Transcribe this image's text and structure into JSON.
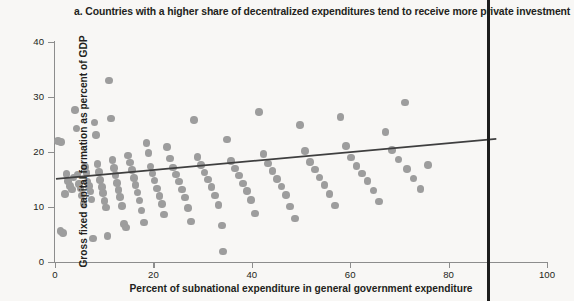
{
  "chart_data": {
    "type": "scatter",
    "title": "a. Countries with a higher share of decentralized expenditures tend to receive more private investment",
    "xlabel": "Percent of subnational expenditure in general government expenditure",
    "ylabel": "Gross fixed capital formation as percent of GDP",
    "xlim": [
      0,
      100
    ],
    "ylim": [
      0,
      40
    ],
    "xticks": [
      0,
      20,
      40,
      60,
      80,
      100
    ],
    "yticks": [
      0,
      10,
      20,
      30,
      40
    ],
    "grid": false,
    "legend": null,
    "marker_color": "#9d9d9d",
    "trendline_color": "#3f3f3f",
    "background_color": "#f8f7f5",
    "axis_color": "#8d8d8d",
    "text_color": "#231f20",
    "trendline": {
      "type": "linear",
      "x_start": 0.2,
      "y_start": 15.1,
      "x_end": 89.7,
      "y_end": 22.4
    },
    "points": [
      [
        0.6,
        22.0
      ],
      [
        1.2,
        21.8
      ],
      [
        1.1,
        5.6
      ],
      [
        1.6,
        5.3
      ],
      [
        2.0,
        12.4
      ],
      [
        2.3,
        16.0
      ],
      [
        2.6,
        14.7
      ],
      [
        3.0,
        13.8
      ],
      [
        3.4,
        13.2
      ],
      [
        3.8,
        15.4
      ],
      [
        4.1,
        27.6
      ],
      [
        4.4,
        24.3
      ],
      [
        4.6,
        15.9
      ],
      [
        4.9,
        14.2
      ],
      [
        5.2,
        13.4
      ],
      [
        5.4,
        12.1
      ],
      [
        5.8,
        10.6
      ],
      [
        6.1,
        17.3
      ],
      [
        6.4,
        16.2
      ],
      [
        6.6,
        14.6
      ],
      [
        6.9,
        13.8
      ],
      [
        7.2,
        12.8
      ],
      [
        7.4,
        11.4
      ],
      [
        7.7,
        4.3
      ],
      [
        8.0,
        25.4
      ],
      [
        8.3,
        23.1
      ],
      [
        8.6,
        17.8
      ],
      [
        8.9,
        16.4
      ],
      [
        9.2,
        14.9
      ],
      [
        9.5,
        13.6
      ],
      [
        9.8,
        12.5
      ],
      [
        10.1,
        11.1
      ],
      [
        10.4,
        9.9
      ],
      [
        10.7,
        4.7
      ],
      [
        11.0,
        33.0
      ],
      [
        11.4,
        26.1
      ],
      [
        11.7,
        18.5
      ],
      [
        12.0,
        17.1
      ],
      [
        12.3,
        15.8
      ],
      [
        12.6,
        14.4
      ],
      [
        12.9,
        13.1
      ],
      [
        13.2,
        11.8
      ],
      [
        13.6,
        10.2
      ],
      [
        14.0,
        6.9
      ],
      [
        14.4,
        6.3
      ],
      [
        14.8,
        19.4
      ],
      [
        15.2,
        18.1
      ],
      [
        15.6,
        16.7
      ],
      [
        16.0,
        15.3
      ],
      [
        16.4,
        14.0
      ],
      [
        16.8,
        12.6
      ],
      [
        17.2,
        11.2
      ],
      [
        17.6,
        9.4
      ],
      [
        18.1,
        7.2
      ],
      [
        18.6,
        21.6
      ],
      [
        19.0,
        19.8
      ],
      [
        19.4,
        17.4
      ],
      [
        19.8,
        16.1
      ],
      [
        20.2,
        14.8
      ],
      [
        20.7,
        13.4
      ],
      [
        21.2,
        12.0
      ],
      [
        21.7,
        10.5
      ],
      [
        22.2,
        8.6
      ],
      [
        22.8,
        20.9
      ],
      [
        23.4,
        18.8
      ],
      [
        24.0,
        17.2
      ],
      [
        24.6,
        15.9
      ],
      [
        25.2,
        14.6
      ],
      [
        25.8,
        13.2
      ],
      [
        26.4,
        11.7
      ],
      [
        27.0,
        9.8
      ],
      [
        27.6,
        7.4
      ],
      [
        28.3,
        25.8
      ],
      [
        29.0,
        19.1
      ],
      [
        29.7,
        17.6
      ],
      [
        30.4,
        16.3
      ],
      [
        31.1,
        15.0
      ],
      [
        31.8,
        13.6
      ],
      [
        32.5,
        12.1
      ],
      [
        33.2,
        10.4
      ],
      [
        34.0,
        6.6
      ],
      [
        34.2,
        1.9
      ],
      [
        35.0,
        22.3
      ],
      [
        35.8,
        18.4
      ],
      [
        36.6,
        17.0
      ],
      [
        37.4,
        15.7
      ],
      [
        38.2,
        14.3
      ],
      [
        39.0,
        12.9
      ],
      [
        39.8,
        11.3
      ],
      [
        40.6,
        8.8
      ],
      [
        41.5,
        27.3
      ],
      [
        42.4,
        19.6
      ],
      [
        43.3,
        17.9
      ],
      [
        44.2,
        16.5
      ],
      [
        45.1,
        15.1
      ],
      [
        46.0,
        13.7
      ],
      [
        46.9,
        12.2
      ],
      [
        47.8,
        10.1
      ],
      [
        48.8,
        7.9
      ],
      [
        49.8,
        24.9
      ],
      [
        50.8,
        20.2
      ],
      [
        51.8,
        18.2
      ],
      [
        52.8,
        16.8
      ],
      [
        53.8,
        15.4
      ],
      [
        54.8,
        14.0
      ],
      [
        55.8,
        12.4
      ],
      [
        56.9,
        10.3
      ],
      [
        58.0,
        26.4
      ],
      [
        59.1,
        21.1
      ],
      [
        60.2,
        19.0
      ],
      [
        61.3,
        17.5
      ],
      [
        62.4,
        16.1
      ],
      [
        63.5,
        14.7
      ],
      [
        64.7,
        13.0
      ],
      [
        65.9,
        11.0
      ],
      [
        67.2,
        23.6
      ],
      [
        68.5,
        20.4
      ],
      [
        69.8,
        18.6
      ],
      [
        71.1,
        29.0
      ],
      [
        71.5,
        16.9
      ],
      [
        72.9,
        15.2
      ],
      [
        74.3,
        13.3
      ],
      [
        75.8,
        17.6
      ]
    ]
  }
}
